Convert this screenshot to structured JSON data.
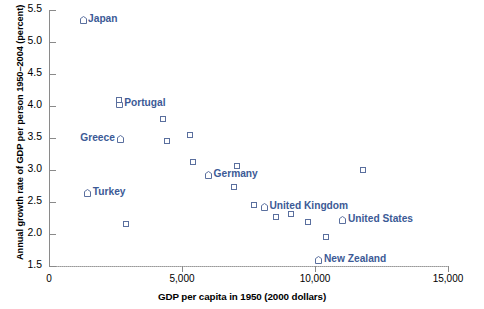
{
  "chart_data": {
    "type": "scatter",
    "title": "",
    "xlabel": "GDP per capita in 1950 (2000 dollars)",
    "ylabel": "Annual growth rate of GDP per person 1950–2004  (percent)",
    "xlim": [
      0,
      15000
    ],
    "ylim": [
      1.5,
      5.5
    ],
    "xticks": [
      0,
      5000,
      10000,
      15000
    ],
    "xtick_labels": [
      "0",
      "5,000",
      "10,000",
      "15,000"
    ],
    "yticks": [
      1.5,
      2.0,
      2.5,
      3.0,
      3.5,
      4.0,
      4.5,
      5.0,
      5.5
    ],
    "ytick_labels": [
      "1.5",
      "2.0",
      "2.5",
      "3.0",
      "3.5",
      "4.0",
      "4.5",
      "5.0",
      "5.5"
    ],
    "grid": false,
    "legend": "none",
    "marker_color": "#5a6f9e",
    "label_color": "#3c5a96",
    "points": [
      {
        "name": "Japan",
        "x": 1280,
        "y": 5.35,
        "labeled": true,
        "label_side": "right"
      },
      {
        "name": "Portugal",
        "x": 2640,
        "y": 4.03,
        "labeled": true,
        "label_side": "right"
      },
      {
        "name": "Greece",
        "x": 2700,
        "y": 3.48,
        "labeled": true,
        "label_side": "left"
      },
      {
        "name": "Turkey",
        "x": 1460,
        "y": 2.64,
        "labeled": true,
        "label_side": "right"
      },
      {
        "name": "Germany",
        "x": 6000,
        "y": 2.92,
        "labeled": true,
        "label_side": "right"
      },
      {
        "name": "United Kingdom",
        "x": 8100,
        "y": 2.42,
        "labeled": true,
        "label_side": "right"
      },
      {
        "name": "United States",
        "x": 11050,
        "y": 2.22,
        "labeled": true,
        "label_side": "right"
      },
      {
        "name": "New Zealand",
        "x": 10150,
        "y": 1.6,
        "labeled": true,
        "label_side": "right"
      },
      {
        "name": "",
        "x": 2640,
        "y": 4.1,
        "labeled": false
      },
      {
        "name": "",
        "x": 4280,
        "y": 3.8,
        "labeled": false
      },
      {
        "name": "",
        "x": 4450,
        "y": 3.46,
        "labeled": false
      },
      {
        "name": "",
        "x": 5300,
        "y": 3.54,
        "labeled": false
      },
      {
        "name": "",
        "x": 5420,
        "y": 3.12,
        "labeled": false
      },
      {
        "name": "",
        "x": 2880,
        "y": 2.16,
        "labeled": false
      },
      {
        "name": "",
        "x": 7050,
        "y": 3.06,
        "labeled": false
      },
      {
        "name": "",
        "x": 6960,
        "y": 2.74,
        "labeled": false
      },
      {
        "name": "",
        "x": 11790,
        "y": 3.0,
        "labeled": false
      },
      {
        "name": "",
        "x": 7700,
        "y": 2.45,
        "labeled": false
      },
      {
        "name": "",
        "x": 8540,
        "y": 2.26,
        "labeled": false
      },
      {
        "name": "",
        "x": 9100,
        "y": 2.31,
        "labeled": false
      },
      {
        "name": "",
        "x": 9720,
        "y": 2.18,
        "labeled": false
      },
      {
        "name": "",
        "x": 10400,
        "y": 1.95,
        "labeled": false
      }
    ]
  }
}
